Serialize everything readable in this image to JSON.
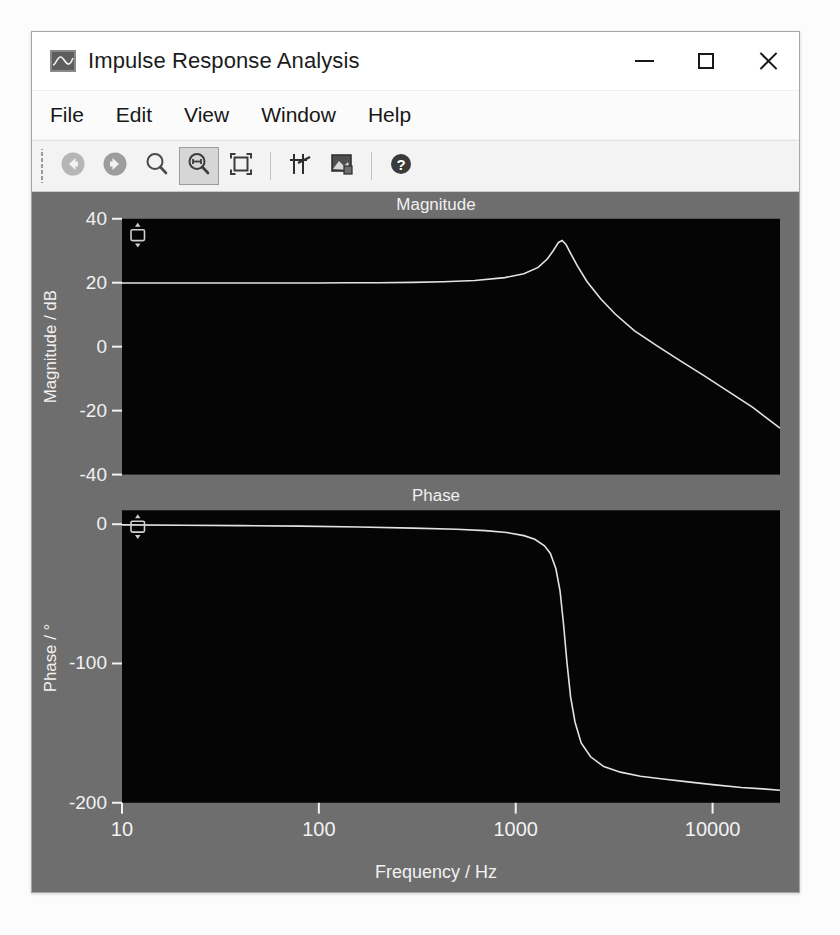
{
  "window": {
    "title": "Impulse Response Analysis",
    "app_icon": "waveform-icon",
    "controls": {
      "minimize": "minimize-button",
      "maximize": "maximize-button",
      "close": "close-button"
    }
  },
  "menubar": {
    "items": [
      {
        "label": "File"
      },
      {
        "label": "Edit"
      },
      {
        "label": "View"
      },
      {
        "label": "Window"
      },
      {
        "label": "Help"
      }
    ]
  },
  "toolbar": {
    "buttons": [
      {
        "name": "back-button",
        "icon": "arrow-left-circle-icon",
        "active": false
      },
      {
        "name": "forward-button",
        "icon": "arrow-right-circle-icon",
        "active": false
      },
      {
        "name": "zoom-button",
        "icon": "magnifier-icon",
        "active": false
      },
      {
        "name": "zoom-horizontal-button",
        "icon": "magnifier-horizontal-icon",
        "active": true
      },
      {
        "name": "fit-to-window-button",
        "icon": "fit-brackets-icon",
        "active": false
      },
      {
        "name": "cursor-tool-button",
        "icon": "crosshair-axes-icon",
        "active": false
      },
      {
        "name": "export-image-button",
        "icon": "picture-export-icon",
        "active": false
      },
      {
        "name": "help-button",
        "icon": "question-circle-icon",
        "active": false
      }
    ]
  },
  "colors": {
    "canvas_background": "#6e6e6e",
    "plot_background": "#050505",
    "trace": "#e8e8e8",
    "axis_text": "#f2f2f2",
    "window_chrome": "#f0f0f0",
    "titlebar": "#ffffff",
    "toolbar": "#f3f3f3"
  },
  "chart_data": [
    {
      "type": "line",
      "name": "magnitude-plot",
      "title": "Magnitude",
      "xlabel": "",
      "ylabel": "Magnitude / dB",
      "xscale": "log",
      "xlim": [
        10,
        22000
      ],
      "ylim": [
        -40,
        40
      ],
      "xticks": [
        10,
        100,
        1000,
        10000
      ],
      "xticklabels": [
        "10",
        "100",
        "1000",
        "10000"
      ],
      "yticks": [
        -40,
        -20,
        0,
        20,
        40
      ],
      "yticklabels": [
        "-40",
        "-20",
        "0",
        "20",
        "40"
      ],
      "grid": false,
      "legend": null,
      "scale_handle": "vertical-scale-handle",
      "x": [
        10,
        14,
        20,
        30,
        45,
        65,
        95,
        140,
        200,
        300,
        430,
        620,
        880,
        1100,
        1300,
        1450,
        1550,
        1650,
        1720,
        1800,
        1900,
        2050,
        2300,
        2700,
        3200,
        4000,
        5200,
        6800,
        9000,
        12000,
        16000,
        22000
      ],
      "y": [
        19.9,
        19.9,
        19.9,
        19.9,
        19.9,
        19.9,
        19.9,
        20.0,
        20.0,
        20.1,
        20.3,
        20.7,
        21.6,
        22.8,
        24.8,
        27.5,
        30.0,
        32.6,
        33.2,
        32.0,
        29.2,
        25.4,
        20.4,
        15.0,
        10.2,
        5.0,
        0.3,
        -4.3,
        -9.0,
        -14.0,
        -19.0,
        -25.5
      ]
    },
    {
      "type": "line",
      "name": "phase-plot",
      "title": "Phase",
      "xlabel": "Frequency / Hz",
      "ylabel": "Phase / °",
      "xscale": "log",
      "xlim": [
        10,
        22000
      ],
      "ylim": [
        -200,
        10
      ],
      "xticks": [
        10,
        100,
        1000,
        10000
      ],
      "xticklabels": [
        "10",
        "100",
        "1000",
        "10000"
      ],
      "yticks": [
        -200,
        -100,
        0
      ],
      "yticklabels": [
        "-200",
        "-100",
        "0"
      ],
      "grid": false,
      "legend": null,
      "scale_handle": "vertical-scale-handle",
      "x": [
        10,
        20,
        40,
        80,
        160,
        300,
        500,
        700,
        900,
        1100,
        1250,
        1400,
        1500,
        1600,
        1680,
        1750,
        1820,
        1900,
        2000,
        2150,
        2400,
        2800,
        3400,
        4300,
        5600,
        7500,
        10000,
        14000,
        18000,
        22000
      ],
      "y": [
        -0.5,
        -0.7,
        -1.0,
        -1.4,
        -2.0,
        -2.8,
        -3.6,
        -4.6,
        -6.0,
        -8.2,
        -10.8,
        -15.5,
        -21.0,
        -32.0,
        -48.0,
        -72.0,
        -99.0,
        -124.0,
        -142.0,
        -157.0,
        -167.0,
        -174.0,
        -178.0,
        -181.0,
        -183.0,
        -185.0,
        -187.0,
        -189.0,
        -190.0,
        -191.0
      ]
    }
  ]
}
